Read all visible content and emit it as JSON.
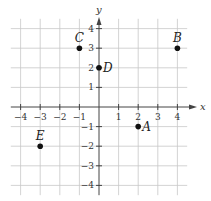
{
  "chart_data": {
    "type": "scatter",
    "title": "",
    "xlabel": "x",
    "ylabel": "y",
    "xlim": [
      -4.5,
      4.5
    ],
    "ylim": [
      -4.5,
      4.5
    ],
    "grid": true,
    "x_ticks": [
      -4,
      -3,
      -2,
      -1,
      1,
      2,
      3,
      4
    ],
    "y_ticks": [
      4,
      3,
      2,
      1,
      -1,
      -2,
      -3,
      -4
    ],
    "x_tick_labels": [
      "−4",
      "−3",
      "−2",
      "−1",
      "1",
      "2",
      "3",
      "4"
    ],
    "y_tick_labels": [
      "4",
      "3",
      "2",
      "1",
      "−1",
      "−2",
      "−3",
      "−4"
    ],
    "points": [
      {
        "label": "A",
        "x": 2,
        "y": -1,
        "label_pos": "right"
      },
      {
        "label": "B",
        "x": 4,
        "y": 3,
        "label_pos": "above"
      },
      {
        "label": "C",
        "x": -1,
        "y": 3,
        "label_pos": "above"
      },
      {
        "label": "D",
        "x": 0,
        "y": 2,
        "label_pos": "right"
      },
      {
        "label": "E",
        "x": -3,
        "y": -2,
        "label_pos": "above"
      }
    ]
  },
  "colors": {
    "grid": "#c8c8c8",
    "axis": "#444444",
    "point": "#111111"
  }
}
